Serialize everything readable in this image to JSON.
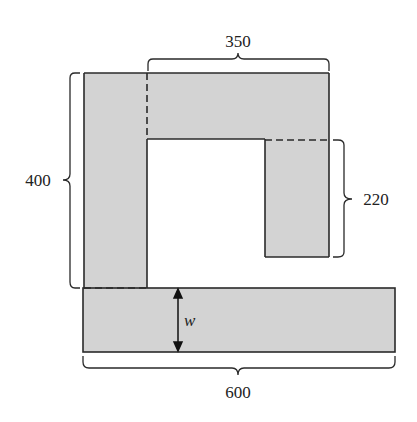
{
  "diagram": {
    "colors": {
      "fill": "#d3d3d3",
      "stroke": "#2a2a2a",
      "background": "#ffffff"
    },
    "labels": {
      "top_width": "350",
      "left_height": "400",
      "right_height": "220",
      "bottom_width": "600",
      "bar_thickness": "w"
    },
    "shapes": [
      {
        "name": "left-column",
        "note": "vertical strip on the left, height 400"
      },
      {
        "name": "top-bar",
        "note": "horizontal strip across top, width 350"
      },
      {
        "name": "right-column",
        "note": "hanging strip on right, height 220"
      },
      {
        "name": "bottom-bar",
        "note": "wide bar at bottom, width 600, thickness w"
      }
    ]
  }
}
